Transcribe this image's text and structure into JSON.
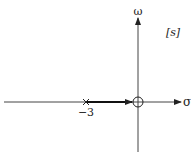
{
  "diagram": {
    "type": "root-locus",
    "plane_label": "[s]",
    "axes": {
      "horizontal_label": "σ",
      "vertical_label": "ω"
    },
    "poles": [
      {
        "value": -3,
        "label": "−3",
        "marker": "x"
      }
    ],
    "zeros": [
      {
        "value": 0,
        "marker": "o"
      }
    ],
    "locus_branches": [
      {
        "from": -3,
        "to": 0,
        "direction": "toward zero"
      }
    ],
    "colors": {
      "line": "#333333",
      "background": "#ffffff"
    }
  }
}
